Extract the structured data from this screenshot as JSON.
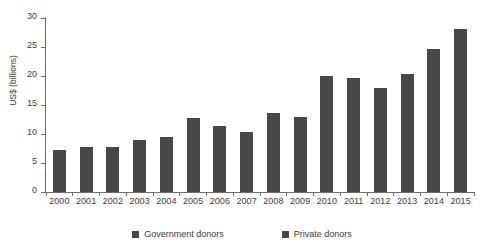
{
  "chart_data": {
    "type": "bar",
    "title": "",
    "subtitle": "",
    "xlabel": "",
    "ylabel": "US$ (billions)",
    "ylim": [
      0,
      30
    ],
    "ytick_values": [
      30,
      25,
      20,
      15,
      10,
      5,
      0
    ],
    "ytick_labels": [
      "30",
      "25",
      "20",
      "15",
      "10",
      "5",
      "0"
    ],
    "grid": false,
    "legend_position": "bottom",
    "bar_color": "#474747",
    "axis_color": "#6e6e6e",
    "text_color": "#3d3d3d",
    "categories": [
      "2000",
      "2001",
      "2002",
      "2003",
      "2004",
      "2005",
      "2006",
      "2007",
      "2008",
      "2009",
      "2010",
      "2011",
      "2012",
      "2013",
      "2014",
      "2015"
    ],
    "values": [
      7.2,
      7.8,
      7.7,
      9.0,
      9.4,
      12.8,
      11.4,
      10.4,
      13.6,
      13.0,
      20.0,
      19.7,
      17.9,
      20.4,
      24.6,
      28.1
    ],
    "series": [
      {
        "name": "Government donors",
        "color": "#474747",
        "values": [
          7.2,
          7.8,
          7.7,
          9.0,
          9.4,
          12.8,
          11.4,
          10.4,
          13.6,
          13.0,
          20.0,
          19.7,
          17.9,
          20.4,
          24.6,
          28.1
        ]
      }
    ],
    "legend": [
      {
        "label": "Government donors",
        "color": "#474747"
      },
      {
        "label": "Private donors",
        "color": "#474747"
      }
    ]
  }
}
